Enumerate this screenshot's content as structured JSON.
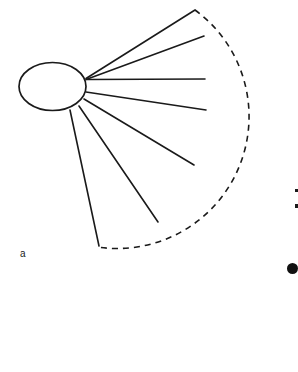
{
  "figure": {
    "panel_label": "a",
    "background_color": "#ffffff",
    "stroke_color": "#1a1a1a",
    "body": {
      "shape": "ellipse",
      "cx": 52.5,
      "cy": 86.5,
      "rx": 33.5,
      "ry": 24.0,
      "stroke_width": 1.6,
      "fill": "#ffffff"
    },
    "rays": [
      {
        "id": "ray-1",
        "x1": 86.0,
        "y1": 78.5,
        "x2": 195.0,
        "y2": 10.0
      },
      {
        "id": "ray-2",
        "x1": 86.0,
        "y1": 79.5,
        "x2": 204.0,
        "y2": 36.0
      },
      {
        "id": "ray-3",
        "x1": 86.5,
        "y1": 79.5,
        "x2": 205.0,
        "y2": 79.0
      },
      {
        "id": "ray-4",
        "x1": 86.0,
        "y1": 92.0,
        "x2": 206.0,
        "y2": 110.0
      },
      {
        "id": "ray-5",
        "x1": 84.0,
        "y1": 99.0,
        "x2": 194.0,
        "y2": 165.0
      },
      {
        "id": "ray-6",
        "x1": 79.0,
        "y1": 106.0,
        "x2": 158.0,
        "y2": 222.0
      },
      {
        "id": "ray-7",
        "x1": 70.0,
        "y1": 110.0,
        "x2": 99.0,
        "y2": 246.0
      }
    ],
    "arc": {
      "id": "outer-arc",
      "style": "dashed",
      "dash_pattern": "6 5",
      "stroke_width": 1.6,
      "start_x": 195.0,
      "start_y": 10.0,
      "end_x": 97.0,
      "end_y": 247.0,
      "radius_x": 132.0,
      "radius_y": 132.0,
      "sweep": 1,
      "large_arc": 0
    },
    "edge_marks": [
      {
        "id": "edge-tick-1",
        "top": 189,
        "height": 3
      },
      {
        "id": "edge-tick-2",
        "top": 204,
        "height": 4
      }
    ],
    "edge_bullet": {
      "id": "edge-bullet",
      "top": 263
    }
  }
}
